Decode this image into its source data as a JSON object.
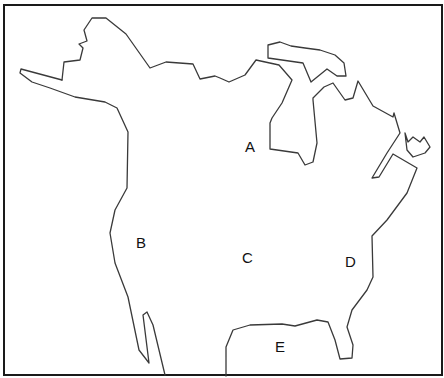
{
  "map": {
    "title": "Outline map of North America",
    "region_labels": [
      {
        "id": "A",
        "text": "A",
        "x": 245,
        "y": 139
      },
      {
        "id": "B",
        "text": "B",
        "x": 136,
        "y": 235
      },
      {
        "id": "C",
        "text": "C",
        "x": 242,
        "y": 250
      },
      {
        "id": "D",
        "text": "D",
        "x": 345,
        "y": 254
      },
      {
        "id": "E",
        "text": "E",
        "x": 275,
        "y": 339
      }
    ],
    "colors": {
      "outline": "#3a3a3a",
      "frame": "#1a1a1a",
      "background": "#ffffff",
      "label": "#111111"
    }
  }
}
